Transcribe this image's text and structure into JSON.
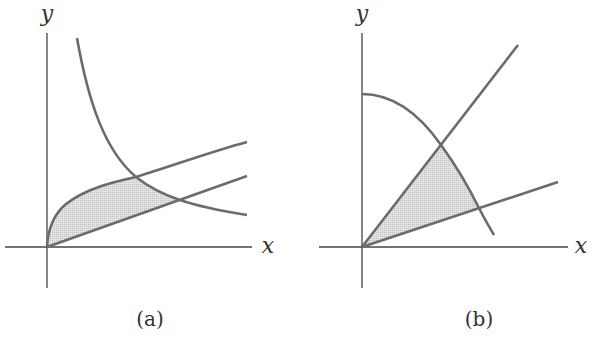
{
  "panels": [
    {
      "id": "a",
      "caption": "(a)",
      "x_label": "x",
      "y_label": "y",
      "curves": [
        "hyperbola (decreasing)",
        "square-root curve",
        "straight line through origin"
      ],
      "shaded_region": "bounded by square-root curve, line, and hyperbola"
    },
    {
      "id": "b",
      "caption": "(b)",
      "x_label": "x",
      "y_label": "y",
      "curves": [
        "circular arc (quarter circle)",
        "steep line through origin",
        "shallow line through origin"
      ],
      "shaded_region": "sector between two lines inside circular arc"
    }
  ],
  "colors": {
    "axis": "#444444",
    "curve": "#6b6b6b",
    "shade": "#dcdcdc",
    "background": "#ffffff"
  }
}
